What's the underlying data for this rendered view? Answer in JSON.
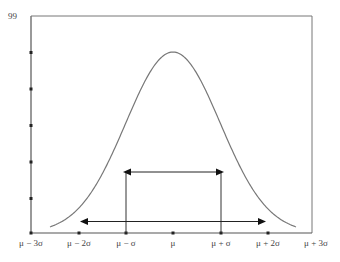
{
  "chart_data": {
    "type": "line",
    "title": "",
    "xlabel": "",
    "ylabel": "",
    "y_top_label": "99",
    "categories": [
      "μ − 3σ",
      "μ − 2σ",
      "μ − σ",
      "μ",
      "μ + σ",
      "μ + 2σ",
      "μ + 3σ"
    ],
    "series": [
      {
        "name": "Normal distribution curve",
        "x": [
          -3,
          -2.5,
          -2,
          -1.5,
          -1,
          -0.5,
          0,
          0.5,
          1,
          1.5,
          2,
          2.5,
          3
        ],
        "values": [
          0.4,
          1.6,
          5.4,
          13.0,
          24.2,
          35.2,
          39.9,
          35.2,
          24.2,
          13.0,
          5.4,
          1.6,
          0.4
        ]
      }
    ],
    "annotations": [
      {
        "type": "double-arrow",
        "from": "μ − σ",
        "to": "μ + σ",
        "meaning": "±1σ range"
      },
      {
        "type": "double-arrow",
        "from": "μ − 2σ",
        "to": "μ + 2σ",
        "meaning": "±2σ range"
      }
    ],
    "ylim": [
      0,
      99
    ],
    "y_ticks_count": 5,
    "grid": false,
    "legend": "none"
  },
  "labels": {
    "ymax": "99",
    "x": [
      "μ − 3σ",
      "μ − 2σ",
      "μ − σ",
      "μ",
      "μ + σ",
      "μ + 2σ",
      "μ + 3σ"
    ]
  },
  "colors": {
    "axis": "#555555",
    "curve": "#777777",
    "arrows": "#222222"
  }
}
